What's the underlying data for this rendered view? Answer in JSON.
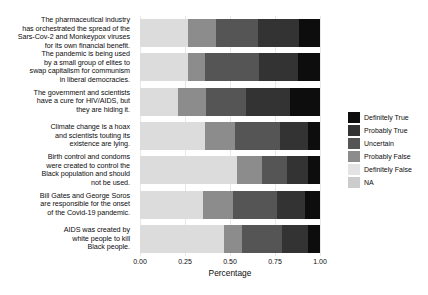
{
  "chart_data": {
    "type": "bar",
    "orientation": "horizontal",
    "stacked": true,
    "normalized": true,
    "title": "",
    "xlabel": "Percentage",
    "ylabel": "",
    "xlim": [
      0.0,
      1.0
    ],
    "xticks": [
      "0.00",
      "0.25",
      "0.50",
      "0.75",
      "1.00"
    ],
    "xtick_values": [
      0.0,
      0.25,
      0.5,
      0.75,
      1.0
    ],
    "grid": true,
    "legend_position": "right",
    "legend_title": "",
    "categories": [
      "The pharmaceutical industry\nhas orchestrated the spread of the\nSars-Cov-2 and Monkeypox viruses\nfor its own financial benefit.",
      "The pandemic is being used\nby a small group of elites to\nswap capitalism for communism\nin liberal democracies.",
      "The government and scientists\nhave a cure for HIV/AIDS, but\nthey are hiding it.",
      "Climate change is a hoax\nand scientists touting its\nexistence are lying.",
      "Birth control and condoms\nwere created to control the\nBlack population and should\nnot be used.",
      "Bill Gates and George Soros\nare responsible for the onset\nof the Covid-19 pandemic.",
      "AIDS was created by\nwhite people to kill\nBlack people."
    ],
    "series": [
      {
        "name": "Definitely True",
        "color": "#0d0d0d",
        "values": [
          0.116,
          0.122,
          0.167,
          0.067,
          0.066,
          0.083,
          0.067
        ]
      },
      {
        "name": "Probably True",
        "color": "#333333",
        "values": [
          0.228,
          0.217,
          0.244,
          0.156,
          0.117,
          0.156,
          0.144
        ]
      },
      {
        "name": "Uncertain",
        "color": "#555555",
        "values": [
          0.233,
          0.3,
          0.222,
          0.25,
          0.139,
          0.244,
          0.222
        ]
      },
      {
        "name": "Probably False",
        "color": "#8c8c8c",
        "values": [
          0.156,
          0.094,
          0.156,
          0.167,
          0.139,
          0.167,
          0.1
        ]
      },
      {
        "name": "Definitely False",
        "color": "#dcdcdc",
        "values": [
          0.267,
          0.267,
          0.211,
          0.361,
          0.539,
          0.35,
          0.467
        ]
      },
      {
        "name": "NA",
        "color": "#c9c9c9",
        "values": [
          0.0,
          0.0,
          0.0,
          0.0,
          0.0,
          0.0,
          0.0
        ]
      }
    ],
    "stack_order": [
      "Definitely False",
      "Probably False",
      "Uncertain",
      "Probably True",
      "Definitely True"
    ]
  },
  "legend": {
    "items": [
      {
        "label": "Definitely True",
        "color": "#0d0d0d"
      },
      {
        "label": "Probably True",
        "color": "#333333"
      },
      {
        "label": "Uncertain",
        "color": "#555555"
      },
      {
        "label": "Probably False",
        "color": "#8c8c8c"
      },
      {
        "label": "Definitely False",
        "color": "#e3e3e3"
      },
      {
        "label": "NA",
        "color": "#cccccc"
      }
    ]
  },
  "axis": {
    "x_title": "Percentage"
  }
}
